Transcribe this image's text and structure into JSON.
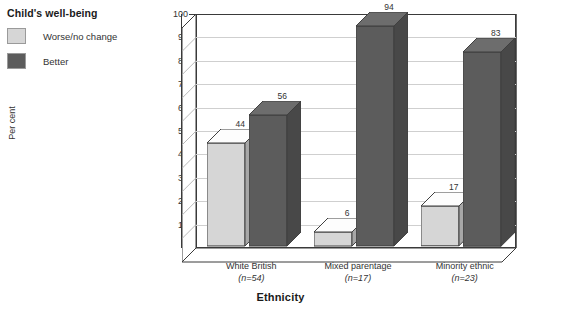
{
  "legend": {
    "title": "Child's well-being",
    "items": [
      {
        "label": "Worse/no change",
        "color": "#d6d6d6"
      },
      {
        "label": "Better",
        "color": "#5c5c5c"
      }
    ]
  },
  "chart_data": {
    "type": "bar",
    "title": "",
    "xlabel": "Ethnicity",
    "ylabel": "Per cent",
    "ylim": [
      0,
      100
    ],
    "ytick_step": 10,
    "yticks": [
      "0",
      "10",
      "20",
      "30",
      "40",
      "50",
      "60",
      "70",
      "80",
      "90",
      "100"
    ],
    "grid": true,
    "legend_position": "top-left",
    "categories": [
      "White British",
      "Mixed parentage",
      "Minority ethnic"
    ],
    "category_sublabels": [
      "(n=54)",
      "(n=17)",
      "(n=23)"
    ],
    "series": [
      {
        "name": "Worse/no change",
        "color": "#d6d6d6",
        "values": [
          44,
          6,
          17
        ]
      },
      {
        "name": "Better",
        "color": "#5c5c5c",
        "values": [
          56,
          94,
          83
        ]
      }
    ],
    "data_labels": [
      "44",
      "56",
      "6",
      "94",
      "17",
      "83"
    ]
  }
}
